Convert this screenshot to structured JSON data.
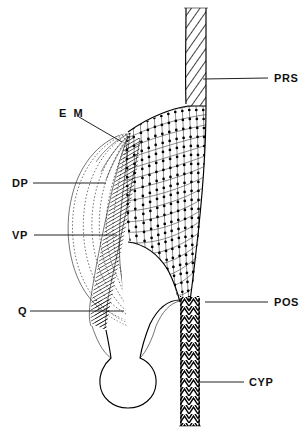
{
  "figure": {
    "domain": "anatomical-diagram",
    "title": "",
    "background_color": "#ffffff",
    "ink_color": "#000000",
    "width": 307,
    "height": 434
  },
  "labels": [
    {
      "id": "prs",
      "text": "PRS",
      "meaning": "pre-oral sclerite / anterior rod structure",
      "text_x": 274,
      "text_y": 82,
      "leader_from_x": 268,
      "leader_from_y": 78,
      "leader_to_x": 203,
      "leader_to_y": 79,
      "side": "right"
    },
    {
      "id": "em",
      "text": "E M",
      "meaning": "external membrane",
      "text_x": 59,
      "text_y": 113,
      "leader_from_x": 79,
      "leader_from_y": 117,
      "leader_to_x": 120,
      "leader_to_y": 141,
      "side": "left"
    },
    {
      "id": "dp",
      "text": "DP",
      "meaning": "dorsal protractor",
      "text_x": 12,
      "text_y": 186,
      "leader_from_x": 33,
      "leader_from_y": 183,
      "leader_to_x": 106,
      "leader_to_y": 183,
      "side": "left"
    },
    {
      "id": "vp",
      "text": "VP",
      "meaning": "ventral protractor",
      "text_x": 12,
      "text_y": 238,
      "leader_from_x": 34,
      "leader_from_y": 235,
      "leader_to_x": 117,
      "leader_to_y": 235,
      "side": "left"
    },
    {
      "id": "q",
      "text": "Q",
      "meaning": "quadrate",
      "text_x": 18,
      "text_y": 315,
      "leader_from_x": 30,
      "leader_from_y": 311,
      "leader_to_x": 124,
      "leader_to_y": 311,
      "side": "left"
    },
    {
      "id": "pos",
      "text": "POS",
      "meaning": "post-oral sclerite",
      "text_x": 274,
      "text_y": 306,
      "leader_from_x": 268,
      "leader_from_y": 302,
      "leader_to_x": 205,
      "leader_to_y": 302,
      "side": "right"
    },
    {
      "id": "cyp",
      "text": "CYP",
      "meaning": "cylindrical pharynx / cypsella",
      "text_x": 249,
      "text_y": 386,
      "leader_from_x": 244,
      "leader_from_y": 382,
      "leader_to_x": 197,
      "leader_to_y": 382,
      "side": "right"
    }
  ],
  "regions": [
    {
      "id": "upper-tube",
      "label_ref": "prs",
      "fill_pattern": "diagonal-hatch"
    },
    {
      "id": "main-body",
      "label_ref": "em",
      "fill_pattern": "beaded-grid"
    },
    {
      "id": "fan-muscles",
      "label_ref": "dp",
      "fill_pattern": "dotted-curves"
    },
    {
      "id": "hatched-band",
      "label_ref": "vp",
      "fill_pattern": "dense-hatch"
    },
    {
      "id": "quadrate-knob",
      "label_ref": "q",
      "fill_pattern": "outline"
    },
    {
      "id": "lower-tube",
      "label_ref": "pos",
      "fill_pattern": "chevron-hatch"
    },
    {
      "id": "lower-tube-distal",
      "label_ref": "cyp",
      "fill_pattern": "chevron-hatch"
    }
  ]
}
